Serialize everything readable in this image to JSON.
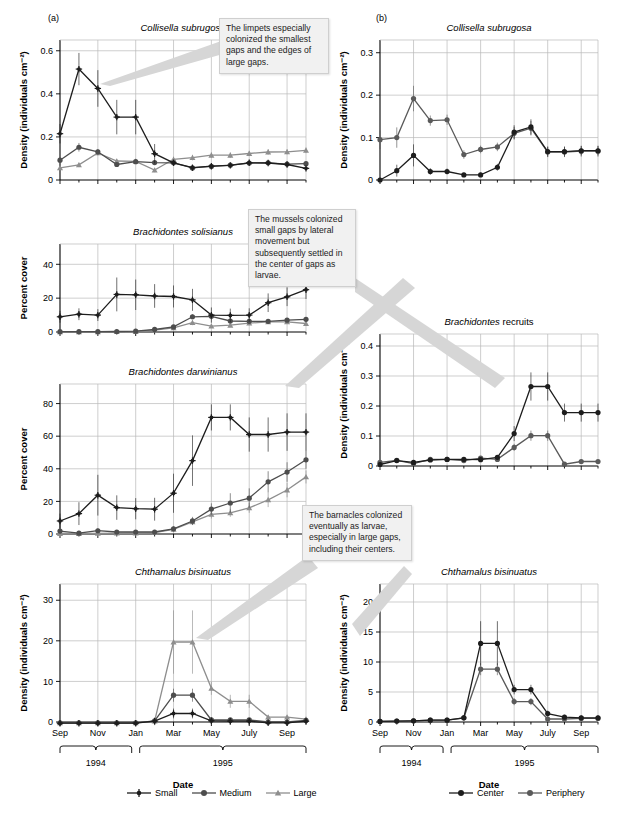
{
  "figure": {
    "panel_letters": {
      "a": "(a)",
      "b": "(b)"
    },
    "axis_titles": {
      "density": "Density (individuals cm⁻²)",
      "percent_cover": "Percent cover",
      "date": "Date"
    },
    "year_labels": [
      "1994",
      "1995"
    ],
    "month_ticks": [
      "Sep",
      "Nov",
      "Jan",
      "Mar",
      "May",
      "July",
      "Sep"
    ]
  },
  "legends": {
    "left": {
      "name": "size-legend",
      "items": [
        {
          "label": "Small",
          "color": "#1d1d1d",
          "marker": "plus-dot"
        },
        {
          "label": "Medium",
          "color": "#4d4d4d",
          "marker": "circle"
        },
        {
          "label": "Large",
          "color": "#8e8e8e",
          "marker": "triangle"
        }
      ]
    },
    "right": {
      "name": "position-legend",
      "items": [
        {
          "label": "Center",
          "color": "#1d1d1d",
          "marker": "circle"
        },
        {
          "label": "Periphery",
          "color": "#5a5a5a",
          "marker": "circle"
        }
      ]
    }
  },
  "callouts": [
    {
      "id": "callout-limpets",
      "text": "The limpets especially colonized the smallest gaps and the edges of large gaps."
    },
    {
      "id": "callout-mussels",
      "text": "The mussels colonized small gaps by lateral movement but subsequently settled in the center of gaps as larvae."
    },
    {
      "id": "callout-barnacles",
      "text": "The barnacles colonized eventually as larvae, especially in large gaps, including their centers."
    }
  ],
  "chart_data": [
    {
      "id": "collisella-left",
      "type": "line",
      "title": "Collisella subrugosa",
      "panel": "(a)",
      "xlabel": "Date",
      "ylabel": "Density (individuals cm⁻²)",
      "ylim": [
        0,
        0.65
      ],
      "yticks": [
        0,
        0.2,
        0.4,
        0.6
      ],
      "yticklabels": [
        "0",
        "0.2",
        "0.4",
        "0.6"
      ],
      "x": [
        0,
        1,
        2,
        3,
        4,
        5,
        6,
        7,
        8,
        9,
        10,
        11,
        12,
        13
      ],
      "xticklabels": [
        "Sep",
        "Nov",
        "Jan",
        "Mar",
        "May",
        "July",
        "Sep"
      ],
      "grid": true,
      "series": [
        {
          "name": "Small",
          "color": "#1d1d1d",
          "marker": "plus-dot",
          "values": [
            0.215,
            0.515,
            0.425,
            0.292,
            0.292,
            0.122,
            0.08,
            0.057,
            0.064,
            0.068,
            0.08,
            0.079,
            0.072,
            0.054
          ],
          "err": [
            0.045,
            0.075,
            0.085,
            0.08,
            0.08,
            0.045,
            0.012,
            0.008,
            0.008,
            0.008,
            0.01,
            0.01,
            0.008,
            0.009
          ]
        },
        {
          "name": "Medium",
          "color": "#4d4d4d",
          "marker": "circle",
          "values": [
            0.092,
            0.152,
            0.131,
            0.072,
            0.085,
            0.081,
            0.08,
            0.056,
            0.063,
            0.069,
            0.079,
            0.08,
            0.074,
            0.076
          ],
          "err": [
            0.012,
            0.02,
            0.013,
            0.01,
            0.008,
            0.008,
            0.008,
            0.007,
            0.007,
            0.007,
            0.008,
            0.009,
            0.008,
            0.008
          ]
        },
        {
          "name": "Large",
          "color": "#8e8e8e",
          "marker": "triangle",
          "values": [
            0.056,
            0.07,
            0.126,
            0.088,
            0.087,
            0.046,
            0.096,
            0.104,
            0.115,
            0.115,
            0.123,
            0.13,
            0.131,
            0.138
          ],
          "err": [
            0.01,
            0.01,
            0.012,
            0.01,
            0.01,
            0.01,
            0.012,
            0.013,
            0.013,
            0.013,
            0.012,
            0.013,
            0.012,
            0.013
          ]
        }
      ]
    },
    {
      "id": "collisella-right",
      "type": "line",
      "title": "Collisella subrugosa",
      "panel": "(b)",
      "xlabel": "Date",
      "ylabel": "Density (individuals cm⁻²)",
      "ylim": [
        0,
        0.33
      ],
      "yticks": [
        0,
        0.1,
        0.2,
        0.3
      ],
      "yticklabels": [
        "0",
        "0.1",
        "0.2",
        "0.3"
      ],
      "x": [
        0,
        1,
        2,
        3,
        4,
        5,
        6,
        7,
        8,
        9,
        10,
        11,
        12,
        13
      ],
      "xticklabels": [
        "Sep",
        "Nov",
        "Jan",
        "Mar",
        "May",
        "July",
        "Sep"
      ],
      "grid": true,
      "series": [
        {
          "name": "Center",
          "color": "#1d1d1d",
          "marker": "circle",
          "values": [
            0.0,
            0.022,
            0.058,
            0.02,
            0.02,
            0.012,
            0.012,
            0.03,
            0.113,
            0.125,
            0.067,
            0.067,
            0.069,
            0.069
          ],
          "err": [
            0.003,
            0.014,
            0.026,
            0.008,
            0.007,
            0.005,
            0.005,
            0.008,
            0.016,
            0.018,
            0.012,
            0.012,
            0.011,
            0.011
          ]
        },
        {
          "name": "Periphery",
          "color": "#5a5a5a",
          "marker": "circle",
          "values": [
            0.095,
            0.1,
            0.192,
            0.14,
            0.142,
            0.06,
            0.072,
            0.078,
            0.11,
            0.122,
            0.066,
            0.066,
            0.068,
            0.068
          ],
          "err": [
            0.022,
            0.024,
            0.03,
            0.012,
            0.012,
            0.01,
            0.009,
            0.01,
            0.015,
            0.017,
            0.012,
            0.012,
            0.013,
            0.013
          ]
        }
      ]
    },
    {
      "id": "brachidontes-solisianus",
      "type": "line",
      "title": "Brachidontes solisianus",
      "xlabel": "Date",
      "ylabel": "Percent cover",
      "ylim": [
        0,
        52
      ],
      "yticks": [
        0,
        20,
        40
      ],
      "yticklabels": [
        "0",
        "20",
        "40"
      ],
      "x": [
        0,
        1,
        2,
        3,
        4,
        5,
        6,
        7,
        8,
        9,
        10,
        11,
        12,
        13
      ],
      "xticklabels": [
        "Sep",
        "Nov",
        "Jan",
        "Mar",
        "May",
        "July",
        "Sep"
      ],
      "grid": true,
      "series": [
        {
          "name": "Small",
          "color": "#1d1d1d",
          "marker": "plus-dot",
          "values": [
            9.0,
            10.5,
            10.0,
            22.2,
            22.0,
            21.3,
            21.0,
            19.0,
            10.0,
            9.8,
            10.0,
            17.3,
            20.8,
            25.0
          ],
          "err": [
            3.5,
            3.5,
            3.5,
            10.0,
            9.0,
            7.0,
            6.5,
            6.5,
            4.5,
            4.0,
            4.0,
            5.5,
            5.5,
            5.5
          ]
        },
        {
          "name": "Medium",
          "color": "#4d4d4d",
          "marker": "circle",
          "values": [
            0.2,
            0.2,
            0.2,
            0.3,
            0.5,
            1.5,
            3.0,
            9.0,
            9.3,
            6.5,
            6.3,
            6.3,
            7.0,
            7.5
          ],
          "err": [
            0.3,
            0.3,
            0.3,
            0.3,
            0.4,
            0.7,
            1.0,
            1.5,
            1.8,
            1.2,
            1.0,
            1.0,
            1.2,
            1.2
          ]
        },
        {
          "name": "Large",
          "color": "#8e8e8e",
          "marker": "triangle",
          "values": [
            0.1,
            0.1,
            0.1,
            0.2,
            0.3,
            1.1,
            2.4,
            5.5,
            3.5,
            4.0,
            5.2,
            6.0,
            6.0,
            5.0
          ],
          "err": [
            0.2,
            0.2,
            0.2,
            0.2,
            0.3,
            0.6,
            0.8,
            1.5,
            1.0,
            1.0,
            1.0,
            1.2,
            1.2,
            1.2
          ]
        }
      ]
    },
    {
      "id": "brachidontes-darwinianus",
      "type": "line",
      "title": "Brachidontes darwinianus",
      "xlabel": "Date",
      "ylabel": "Percent cover",
      "ylim": [
        0,
        92
      ],
      "yticks": [
        0,
        20,
        40,
        60,
        80
      ],
      "yticklabels": [
        "0",
        "20",
        "40",
        "60",
        "80"
      ],
      "x": [
        0,
        1,
        2,
        3,
        4,
        5,
        6,
        7,
        8,
        9,
        10,
        11,
        12,
        13
      ],
      "xticklabels": [
        "Sep",
        "Nov",
        "Jan",
        "Mar",
        "May",
        "July",
        "Sep"
      ],
      "grid": true,
      "series": [
        {
          "name": "Small",
          "color": "#1d1d1d",
          "marker": "plus-dot",
          "values": [
            8.0,
            12.5,
            23.8,
            16.2,
            15.5,
            15.2,
            25.0,
            45.0,
            71.5,
            71.5,
            61.0,
            61.0,
            62.5,
            62.5
          ],
          "err": [
            4.5,
            7.0,
            12.5,
            7.5,
            6.5,
            7.0,
            12.0,
            15.5,
            8.0,
            8.0,
            10.5,
            10.5,
            11.5,
            11.5
          ]
        },
        {
          "name": "Medium",
          "color": "#4d4d4d",
          "marker": "circle",
          "values": [
            1.8,
            0.5,
            2.0,
            1.2,
            1.2,
            1.2,
            3.2,
            8.0,
            15.3,
            19.0,
            22.0,
            32.0,
            38.0,
            45.5
          ],
          "err": [
            1.5,
            1.0,
            1.5,
            1.0,
            1.0,
            1.0,
            1.5,
            2.5,
            3.5,
            6.0,
            6.0,
            6.5,
            6.0,
            5.5
          ]
        },
        {
          "name": "Large",
          "color": "#8e8e8e",
          "marker": "triangle",
          "values": [
            0.3,
            0.3,
            0.4,
            0.5,
            0.6,
            0.8,
            2.8,
            7.5,
            12.0,
            13.0,
            16.0,
            21.0,
            27.0,
            35.0
          ],
          "err": [
            0.5,
            0.5,
            0.5,
            0.5,
            0.5,
            0.7,
            1.2,
            2.0,
            2.5,
            2.5,
            3.0,
            4.5,
            4.5,
            4.0
          ]
        }
      ]
    },
    {
      "id": "brachidontes-recruits",
      "type": "line",
      "title": "Brachidontes recruits",
      "title_style": "partial-italic",
      "xlabel": "Date",
      "ylabel": "Density (individuals cm⁻²)",
      "ylim": [
        0,
        0.44
      ],
      "yticks": [
        0,
        0.1,
        0.2,
        0.3,
        0.4
      ],
      "yticklabels": [
        "0",
        "0.1",
        "0.2",
        "0.3",
        "0.4"
      ],
      "x": [
        0,
        1,
        2,
        3,
        4,
        5,
        6,
        7,
        8,
        9,
        10,
        11,
        12,
        13
      ],
      "xticklabels": [
        "Sep",
        "Nov",
        "Jan",
        "Mar",
        "May",
        "July",
        "Sep"
      ],
      "grid": true,
      "series": [
        {
          "name": "Center",
          "color": "#1d1d1d",
          "marker": "circle",
          "values": [
            0.005,
            0.018,
            0.012,
            0.02,
            0.022,
            0.022,
            0.021,
            0.029,
            0.108,
            0.265,
            0.265,
            0.178,
            0.178,
            0.178
          ],
          "err": [
            0.006,
            0.007,
            0.006,
            0.006,
            0.006,
            0.006,
            0.006,
            0.007,
            0.025,
            0.047,
            0.047,
            0.03,
            0.03,
            0.03
          ]
        },
        {
          "name": "Periphery",
          "color": "#5a5a5a",
          "marker": "circle",
          "values": [
            0.012,
            0.019,
            0.008,
            0.022,
            0.022,
            0.018,
            0.026,
            0.022,
            0.062,
            0.101,
            0.101,
            0.006,
            0.015,
            0.015
          ],
          "err": [
            0.006,
            0.006,
            0.005,
            0.005,
            0.005,
            0.005,
            0.005,
            0.005,
            0.012,
            0.017,
            0.017,
            0.004,
            0.005,
            0.005
          ]
        }
      ]
    },
    {
      "id": "chthamalus-left",
      "type": "line",
      "title": "Chthamalus bisinuatus",
      "xlabel": "Date",
      "ylabel": "Density (individuals cm⁻²)",
      "ylim": [
        0,
        34
      ],
      "yticks": [
        0,
        10,
        20,
        30
      ],
      "yticklabels": [
        "0",
        "10",
        "20",
        "30"
      ],
      "x": [
        0,
        1,
        2,
        3,
        4,
        5,
        6,
        7,
        8,
        9,
        10,
        11,
        12,
        13
      ],
      "xticklabels": [
        "Sep",
        "Nov",
        "Jan",
        "Mar",
        "May",
        "July",
        "Sep"
      ],
      "grid": true,
      "series": [
        {
          "name": "Small",
          "color": "#1d1d1d",
          "marker": "plus-dot",
          "values": [
            -0.3,
            -0.3,
            -0.3,
            -0.3,
            -0.3,
            0.2,
            2.1,
            2.1,
            0.3,
            0.2,
            0.2,
            -0.2,
            -0.2,
            0.2
          ],
          "err": [
            0.3,
            0.3,
            0.3,
            0.3,
            0.3,
            0.4,
            1.2,
            1.2,
            0.4,
            0.4,
            0.4,
            0.3,
            0.3,
            0.4
          ]
        },
        {
          "name": "Medium",
          "color": "#4d4d4d",
          "marker": "circle",
          "values": [
            -0.2,
            -0.2,
            -0.2,
            -0.2,
            -0.2,
            0.3,
            6.6,
            6.6,
            0.5,
            0.5,
            0.5,
            0.0,
            0.0,
            0.4
          ],
          "err": [
            0.3,
            0.3,
            0.3,
            0.3,
            0.3,
            0.4,
            1.6,
            1.6,
            0.5,
            0.5,
            0.5,
            0.3,
            0.3,
            0.4
          ]
        },
        {
          "name": "Large",
          "color": "#8e8e8e",
          "marker": "triangle",
          "values": [
            -0.2,
            -0.2,
            -0.2,
            -0.2,
            -0.2,
            0.2,
            19.7,
            19.7,
            8.3,
            5.1,
            5.1,
            1.2,
            1.2,
            0.7
          ],
          "err": [
            0.3,
            0.3,
            0.3,
            0.3,
            0.3,
            1.0,
            7.8,
            7.8,
            1.6,
            1.6,
            1.6,
            0.4,
            0.4,
            0.4
          ]
        }
      ]
    },
    {
      "id": "chthamalus-right",
      "type": "line",
      "title": "Chthamalus bisinuatus",
      "xlabel": "Date",
      "ylabel": "Density (individuals cm⁻²)",
      "ylim": [
        0,
        23
      ],
      "yticks": [
        0,
        5,
        10,
        15,
        20
      ],
      "yticklabels": [
        "0",
        "5",
        "10",
        "15",
        "20"
      ],
      "x": [
        0,
        1,
        2,
        3,
        4,
        5,
        6,
        7,
        8,
        9,
        10,
        11,
        12,
        13
      ],
      "xticklabels": [
        "Sep",
        "Nov",
        "Jan",
        "Mar",
        "May",
        "July",
        "Sep"
      ],
      "grid": true,
      "series": [
        {
          "name": "Center",
          "color": "#1d1d1d",
          "marker": "circle",
          "values": [
            0.1,
            0.15,
            0.2,
            0.3,
            0.3,
            0.7,
            13.1,
            13.1,
            5.4,
            5.4,
            1.4,
            0.8,
            0.7,
            0.7
          ],
          "err": [
            0.2,
            0.2,
            0.2,
            0.3,
            0.3,
            0.4,
            3.7,
            3.7,
            0.8,
            0.8,
            0.5,
            0.4,
            0.4,
            0.4
          ]
        },
        {
          "name": "Periphery",
          "color": "#5a5a5a",
          "marker": "circle",
          "values": [
            0.1,
            0.15,
            0.2,
            0.3,
            0.3,
            0.7,
            8.8,
            8.8,
            3.4,
            3.4,
            0.5,
            0.5,
            0.6,
            0.6
          ],
          "err": [
            0.2,
            0.2,
            0.2,
            0.3,
            0.3,
            0.4,
            1.0,
            1.0,
            0.6,
            0.6,
            0.3,
            0.3,
            0.3,
            0.3
          ]
        }
      ]
    }
  ]
}
